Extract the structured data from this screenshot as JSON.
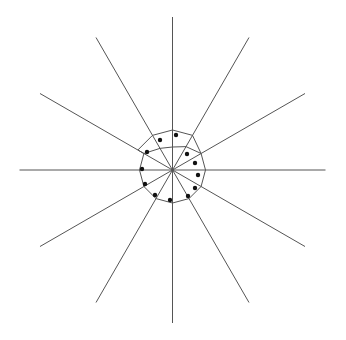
{
  "diagram": {
    "type": "radial-star-with-polygon",
    "center": [
      172.5,
      170
    ],
    "ray_count": 12,
    "ray_length": 153,
    "ray_angle_step_deg": 30,
    "colors": {
      "background": "#ffffff",
      "ray": "#555555",
      "polygon": "#555555",
      "dot": "#111111"
    },
    "base_ring_radius": 33,
    "top_outer_radius": 40,
    "top_inner_radius": 23,
    "dots": [
      [
        176,
        135
      ],
      [
        147,
        152
      ],
      [
        187,
        154
      ],
      [
        195,
        163
      ],
      [
        142,
        169
      ],
      [
        198,
        175
      ],
      [
        145,
        184
      ],
      [
        195,
        188
      ],
      [
        155,
        195
      ],
      [
        188,
        196
      ],
      [
        170,
        200
      ],
      [
        160,
        140
      ]
    ]
  }
}
